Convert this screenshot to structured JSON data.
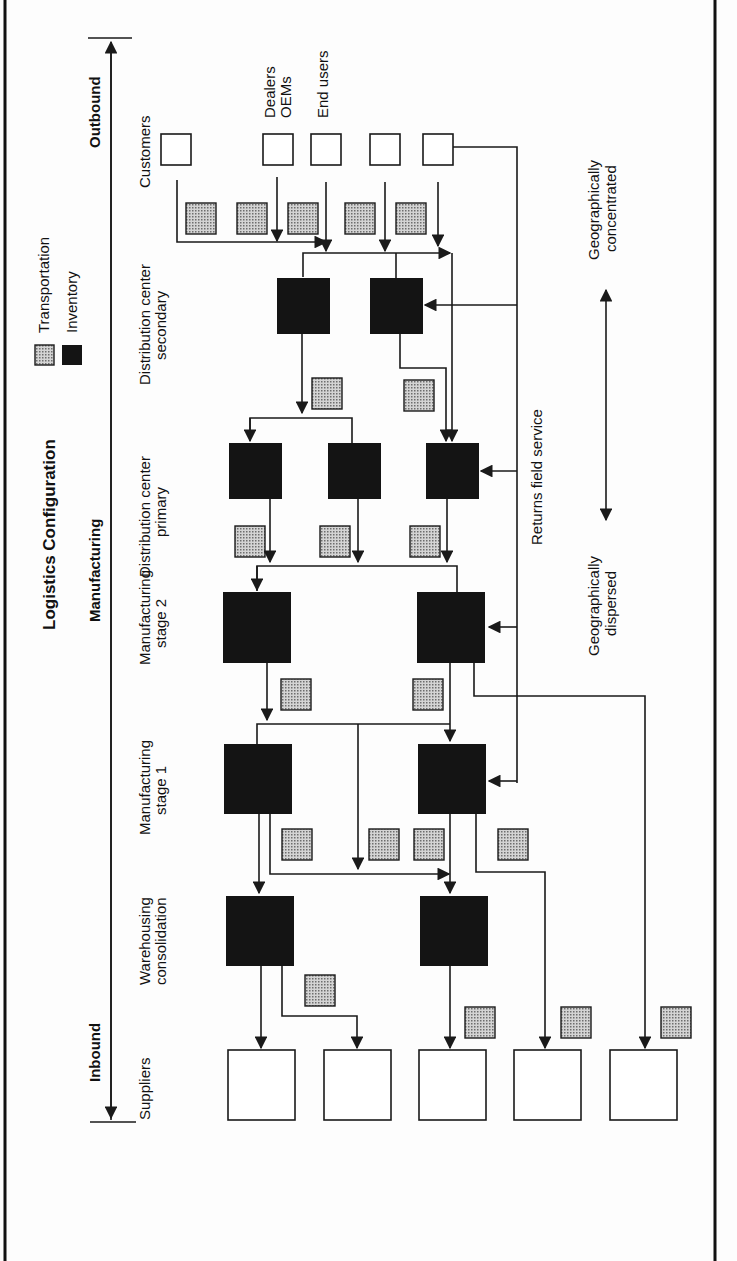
{
  "title": "Logistics Configuration",
  "legend": {
    "transportation": "Transportation",
    "inventory": "Inventory"
  },
  "flow_axis": {
    "outbound": "Outbound",
    "manufacturing": "Manufacturing",
    "inbound": "Inbound"
  },
  "stages": [
    {
      "line1": "Customers",
      "line2": ""
    },
    {
      "line1": "Distribution center",
      "line2": "secondary"
    },
    {
      "line1": "Distribution center",
      "line2": "primary"
    },
    {
      "line1": "Manufacturing",
      "line2": "stage 2"
    },
    {
      "line1": "Manufacturing",
      "line2": "stage 1"
    },
    {
      "line1": "Warehousing",
      "line2": "consolidation"
    },
    {
      "line1": "Suppliers",
      "line2": ""
    }
  ],
  "customer_labels": {
    "dealers": "Dealers",
    "oems": "OEMs",
    "end_users": "End users"
  },
  "returns_label": "Returns field service",
  "geo_axis": {
    "concentrated_1": "Geographically",
    "concentrated_2": "concentrated",
    "dispersed_1": "Geographically",
    "dispersed_2": "dispersed"
  },
  "colors": {
    "inventory": "#141414",
    "transportation": "#bdbdbd",
    "line": "#1a1a1a",
    "background": "#fdfdfd"
  }
}
